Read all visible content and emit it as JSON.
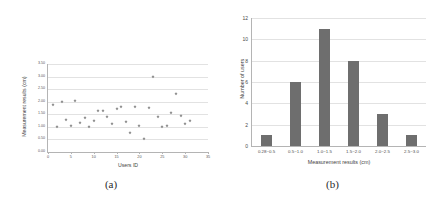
{
  "figure": {
    "panel_a_caption": "(a)",
    "panel_b_caption": "(b)"
  },
  "chart_data": [
    {
      "id": "panel-a",
      "type": "scatter",
      "title": "",
      "xlabel": "Users ID",
      "ylabel": "Measurement results (cm)",
      "xlim": [
        0,
        35
      ],
      "ylim": [
        0.0,
        3.5
      ],
      "xticks": [
        0,
        5,
        10,
        15,
        20,
        25,
        30,
        35
      ],
      "xticklabels": [
        "0",
        "5",
        "10",
        "15",
        "20",
        "25",
        "30",
        "35"
      ],
      "yticks": [
        0.0,
        0.5,
        1.0,
        1.5,
        2.0,
        2.5,
        3.0,
        3.5
      ],
      "yticklabels": [
        "0.00",
        "0.50",
        "1.00",
        "1.50",
        "2.00",
        "2.50",
        "3.00",
        "3.50"
      ],
      "grid": true,
      "legend": false,
      "marker_color": "#8c8c8c",
      "points": [
        {
          "x": 1,
          "y": 1.88
        },
        {
          "x": 2,
          "y": 1.0
        },
        {
          "x": 3,
          "y": 2.0
        },
        {
          "x": 4,
          "y": 1.28
        },
        {
          "x": 5,
          "y": 1.05
        },
        {
          "x": 6,
          "y": 2.02
        },
        {
          "x": 7,
          "y": 1.15
        },
        {
          "x": 8,
          "y": 1.35
        },
        {
          "x": 9,
          "y": 0.98
        },
        {
          "x": 10,
          "y": 1.22
        },
        {
          "x": 11,
          "y": 1.62
        },
        {
          "x": 12,
          "y": 1.65
        },
        {
          "x": 13,
          "y": 1.4
        },
        {
          "x": 14,
          "y": 1.12
        },
        {
          "x": 15,
          "y": 1.72
        },
        {
          "x": 16,
          "y": 1.78
        },
        {
          "x": 17,
          "y": 1.18
        },
        {
          "x": 18,
          "y": 0.75
        },
        {
          "x": 19,
          "y": 1.8
        },
        {
          "x": 20,
          "y": 1.05
        },
        {
          "x": 21,
          "y": 0.52
        },
        {
          "x": 22,
          "y": 1.75
        },
        {
          "x": 23,
          "y": 3.0
        },
        {
          "x": 24,
          "y": 1.38
        },
        {
          "x": 25,
          "y": 0.98
        },
        {
          "x": 26,
          "y": 1.02
        },
        {
          "x": 27,
          "y": 1.55
        },
        {
          "x": 28,
          "y": 2.3
        },
        {
          "x": 29,
          "y": 1.42
        },
        {
          "x": 30,
          "y": 1.1
        },
        {
          "x": 31,
          "y": 1.25
        }
      ]
    },
    {
      "id": "panel-b",
      "type": "bar",
      "title": "",
      "xlabel": "Measurement results (cm)",
      "ylabel": "Number of users",
      "categories": [
        "0.28~0.5",
        "0.5~1.0",
        "1.0~1.5",
        "1.5~2.0",
        "2.0~2.5",
        "2.5~3.0"
      ],
      "values": [
        1,
        6,
        11,
        8,
        3,
        1
      ],
      "ylim": [
        0,
        12
      ],
      "yticks": [
        0,
        2,
        4,
        6,
        8,
        10,
        12
      ],
      "yticklabels": [
        "0",
        "2",
        "4",
        "6",
        "8",
        "10",
        "12"
      ],
      "grid": true,
      "legend": false,
      "bar_color": "#6e6e6e"
    }
  ]
}
